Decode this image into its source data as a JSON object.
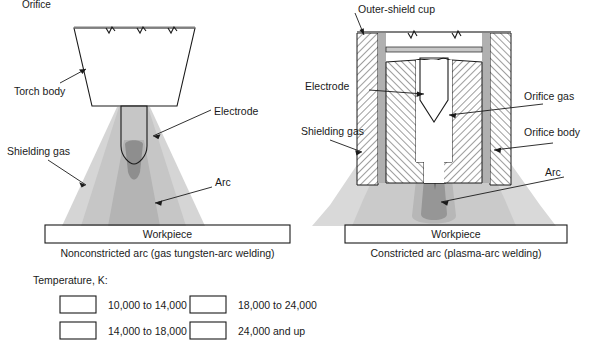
{
  "figure": {
    "top_partial_text": "Orifice",
    "colors": {
      "band_10_14": "#ffffff",
      "band_14_18": "#cfcfcf",
      "band_18_24": "#9a9a9a",
      "band_24_up": "#4a4a4a",
      "outline": "#1a1a1a",
      "hatch": "#1a1a1a",
      "metal_gray": "#b0b0b0",
      "page_bg": "#ffffff"
    }
  },
  "left_diagram": {
    "caption": "Nonconstricted arc (gas tungsten-arc welding)",
    "workpiece_label": "Workpiece",
    "labels": {
      "torch_body": "Torch body",
      "electrode": "Electrode",
      "shielding_gas": "Shielding gas",
      "arc": "Arc"
    }
  },
  "right_diagram": {
    "caption": "Constricted arc (plasma-arc welding)",
    "workpiece_label": "Workpiece",
    "labels": {
      "outer_shield_cup": "Outer-shield cup",
      "electrode": "Electrode",
      "orifice_gas": "Orifice gas",
      "shielding_gas": "Shielding gas",
      "orifice_body": "Orifice body",
      "arc": "Arc"
    }
  },
  "legend": {
    "title": "Temperature, K:",
    "entries": [
      {
        "label": "10,000 to 14,000",
        "color": "#ffffff",
        "swatch_name": "swatch-10000-14000"
      },
      {
        "label": "14,000 to 18,000",
        "color": "#cfcfcf",
        "swatch_name": "swatch-14000-18000"
      },
      {
        "label": "18,000 to 24,000",
        "color": "#9a9a9a",
        "swatch_name": "swatch-18000-24000"
      },
      {
        "label": "24,000 and up",
        "color": "#4a4a4a",
        "swatch_name": "swatch-24000-up"
      }
    ]
  }
}
